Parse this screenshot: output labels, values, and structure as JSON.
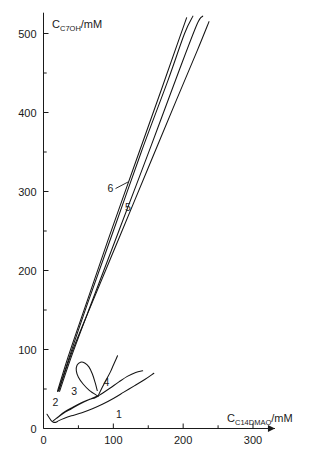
{
  "chart_data": {
    "type": "line",
    "title": "",
    "subtitle": "",
    "xlabel_full": "C_C14DMAO/mM",
    "ylabel_full": "C_C7OH/mM",
    "xlabel_parts": {
      "main": "C",
      "sub": "C",
      "sub2": "14DMAO",
      "unit": "/mM"
    },
    "ylabel_parts": {
      "main": "C",
      "sub": "C",
      "sub2": "7OH",
      "unit": "/mM"
    },
    "xlim": [
      0,
      320
    ],
    "ylim": [
      0,
      520
    ],
    "x_ticks_major": [
      0,
      100,
      200,
      300
    ],
    "x_ticks_major_labels": [
      "0",
      "100",
      "200",
      "300"
    ],
    "x_ticks_minor": [
      50,
      150,
      250
    ],
    "y_ticks_major": [
      0,
      100,
      200,
      300,
      400,
      500
    ],
    "y_ticks_major_labels": [
      "0",
      "100",
      "200",
      "300",
      "400",
      "500"
    ],
    "y_ticks_minor": [
      50,
      150,
      250,
      350,
      450
    ],
    "grid": false,
    "legend_position": "inline-annotations",
    "axis_arrow_x": true,
    "series": [
      {
        "name": "1",
        "label": "1",
        "label_x": 108,
        "label_y": 18,
        "points": [
          [
            5,
            18
          ],
          [
            8,
            14
          ],
          [
            11,
            10
          ],
          [
            14,
            8
          ],
          [
            18,
            8
          ],
          [
            22,
            10
          ],
          [
            30,
            13
          ],
          [
            40,
            16
          ],
          [
            55,
            20
          ],
          [
            70,
            25
          ],
          [
            85,
            31
          ],
          [
            100,
            38
          ],
          [
            115,
            46
          ],
          [
            130,
            54
          ],
          [
            145,
            62
          ],
          [
            158,
            70
          ]
        ]
      },
      {
        "name": "2",
        "label": "2",
        "label_x": 17,
        "label_y": 33,
        "points": [
          [
            13,
            9
          ],
          [
            20,
            14
          ],
          [
            30,
            21
          ],
          [
            42,
            27
          ],
          [
            55,
            33
          ],
          [
            66,
            37
          ],
          [
            74,
            40
          ],
          [
            78,
            41
          ],
          [
            74,
            39
          ],
          [
            64,
            36
          ],
          [
            52,
            31
          ],
          [
            40,
            25
          ],
          [
            28,
            19
          ],
          [
            19,
            13
          ],
          [
            13,
            9
          ]
        ]
      },
      {
        "name": "3",
        "label": "3",
        "label_x": 44,
        "label_y": 47,
        "points": [
          [
            78,
            41
          ],
          [
            66,
            48
          ],
          [
            57,
            56
          ],
          [
            50,
            65
          ],
          [
            47,
            73
          ],
          [
            48,
            80
          ],
          [
            53,
            84
          ],
          [
            59,
            83
          ],
          [
            65,
            78
          ],
          [
            70,
            69
          ],
          [
            74,
            58
          ],
          [
            77,
            48
          ],
          [
            78,
            41
          ]
        ]
      },
      {
        "name": "4",
        "label": "4",
        "label_x": 90,
        "label_y": 59,
        "points": [
          [
            78,
            41
          ],
          [
            85,
            45
          ],
          [
            95,
            51
          ],
          [
            108,
            59
          ],
          [
            120,
            66
          ],
          [
            132,
            71
          ],
          [
            142,
            73
          ],
          [
            78,
            41
          ],
          [
            84,
            52
          ],
          [
            90,
            62
          ],
          [
            96,
            72
          ],
          [
            100,
            80
          ],
          [
            104,
            88
          ],
          [
            106,
            92
          ]
        ]
      },
      {
        "name": "5",
        "label": "5",
        "label_x": 121,
        "label_y": 281,
        "points": [
          [
            22,
            48
          ],
          [
            40,
            95
          ],
          [
            70,
            160
          ],
          [
            110,
            245
          ],
          [
            150,
            330
          ],
          [
            190,
            415
          ],
          [
            220,
            478
          ],
          [
            237,
            515
          ]
        ]
      },
      {
        "name": "6",
        "label": "6",
        "label_x": 96,
        "label_y": 305,
        "points": [
          [
            20,
            47
          ],
          [
            35,
            90
          ],
          [
            60,
            155
          ],
          [
            95,
            245
          ],
          [
            135,
            345
          ],
          [
            170,
            432
          ],
          [
            195,
            495
          ],
          [
            205,
            520
          ]
        ]
      },
      {
        "name": "7",
        "label": "",
        "label_x": null,
        "label_y": null,
        "points": [
          [
            21,
            47
          ],
          [
            38,
            93
          ],
          [
            63,
            158
          ],
          [
            100,
            250
          ],
          [
            140,
            350
          ],
          [
            178,
            440
          ],
          [
            202,
            500
          ],
          [
            214,
            522
          ]
        ]
      },
      {
        "name": "8",
        "label": "",
        "label_x": null,
        "label_y": null,
        "points": [
          [
            23,
            47
          ],
          [
            42,
            96
          ],
          [
            70,
            162
          ],
          [
            110,
            255
          ],
          [
            155,
            360
          ],
          [
            195,
            455
          ],
          [
            220,
            512
          ],
          [
            228,
            522
          ]
        ]
      }
    ],
    "annotations": [
      {
        "text": "6",
        "x": 96,
        "y": 305,
        "leader_to_x": 121,
        "leader_to_y": 312
      },
      {
        "text": "5",
        "x": 121,
        "y": 281,
        "leader_to_x": null,
        "leader_to_y": null
      }
    ]
  }
}
